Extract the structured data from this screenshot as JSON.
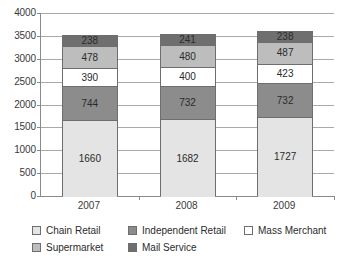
{
  "chart_data": {
    "type": "bar",
    "subtype": "stacked-bar",
    "title": "",
    "subtitle": "",
    "xlabel": "",
    "ylabel": "",
    "categories": [
      "2007",
      "2008",
      "2009"
    ],
    "ylim": [
      0,
      4000
    ],
    "ytick_step": 500,
    "ytick_labels": [
      "4000",
      "3500",
      "3000",
      "2500",
      "2000",
      "1500",
      "1000",
      "500",
      "0"
    ],
    "ytick_values": [
      4000,
      3500,
      3000,
      2500,
      2000,
      1500,
      1000,
      500,
      0
    ],
    "grid": true,
    "grid_axis": "y",
    "legend_position": "bottom",
    "stack_order": "bottom-to-top",
    "series": [
      {
        "name": "Chain Retail",
        "color": "#e4e4e4",
        "values": [
          1660,
          1682,
          1727
        ],
        "labels": [
          "1660",
          "1682",
          "1727"
        ]
      },
      {
        "name": "Independent Retail",
        "color": "#8c8c8c",
        "values": [
          744,
          732,
          732
        ],
        "labels": [
          "744",
          "732",
          "732"
        ]
      },
      {
        "name": "Mass Merchant",
        "color": "#ffffff",
        "values": [
          390,
          400,
          423
        ],
        "labels": [
          "390",
          "400",
          "423"
        ]
      },
      {
        "name": "Supermarket",
        "color": "#bdbdbd",
        "values": [
          478,
          480,
          487
        ],
        "labels": [
          "478",
          "480",
          "487"
        ]
      },
      {
        "name": "Mail Service",
        "color": "#6f6f6f",
        "values": [
          238,
          241,
          238
        ],
        "labels": [
          "238",
          "241",
          "238"
        ]
      }
    ],
    "totals": [
      3510,
      3535,
      3607
    ]
  },
  "legend": {
    "rows": [
      [
        {
          "label": "Chain Retail",
          "color": "#e4e4e4"
        },
        {
          "label": "Independent Retail",
          "color": "#8c8c8c"
        },
        {
          "label": "Mass Merchant",
          "color": "#ffffff"
        }
      ],
      [
        {
          "label": "Supermarket",
          "color": "#bdbdbd"
        },
        {
          "label": "Mail Service",
          "color": "#6f6f6f"
        }
      ]
    ]
  },
  "axis": {
    "line_color": "#8a8a8a",
    "grid_color": "#a9a9a9"
  }
}
